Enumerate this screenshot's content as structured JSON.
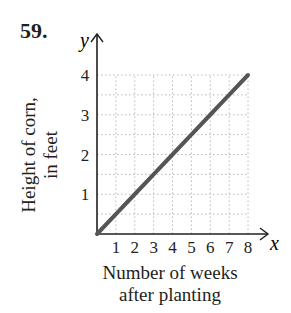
{
  "problem": {
    "number": "59."
  },
  "axes": {
    "x_var": "x",
    "y_var": "y",
    "xlabel_line1": "Number of weeks",
    "xlabel_line2": "after planting",
    "ylabel_line1": "Height of corn,",
    "ylabel_line2": "in feet",
    "x_ticks": [
      "1",
      "2",
      "3",
      "4",
      "5",
      "6",
      "7",
      "8"
    ],
    "y_ticks": [
      "1",
      "2",
      "3",
      "4"
    ]
  },
  "colors": {
    "line": "#555555",
    "grid": "#b8b8b8",
    "axis": "#231f20"
  },
  "chart_data": {
    "type": "line",
    "title": "59.",
    "xlabel": "Number of weeks after planting",
    "ylabel": "Height of corn, in feet",
    "x_var": "x",
    "y_var": "y",
    "xlim": [
      0,
      8
    ],
    "ylim": [
      0,
      4
    ],
    "x_ticks": [
      1,
      2,
      3,
      4,
      5,
      6,
      7,
      8
    ],
    "y_ticks": [
      1,
      2,
      3,
      4
    ],
    "grid": true,
    "grid_x_step": 1,
    "grid_y_step": 0.5,
    "legend": null,
    "series": [
      {
        "name": "Height of corn",
        "x": [
          0,
          1,
          2,
          3,
          4,
          5,
          6,
          7,
          8
        ],
        "y": [
          0,
          0.5,
          1,
          1.5,
          2,
          2.5,
          3,
          3.5,
          4
        ]
      }
    ]
  }
}
